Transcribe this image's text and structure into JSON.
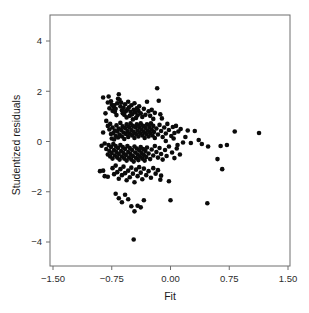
{
  "figure": {
    "background_color": "#ffffff",
    "frame_color": "#6e6e6e",
    "point_color": "#0b0b0b"
  },
  "chart_data": {
    "type": "scatter",
    "title": "",
    "xlabel": "Fit",
    "ylabel": "Studentized residuals",
    "xlim": [
      -1.5,
      1.5
    ],
    "ylim": [
      -4.6,
      4.8
    ],
    "xticks": [
      -1.5,
      -0.75,
      0.0,
      0.75,
      1.5
    ],
    "xtick_labels": [
      "-1.50",
      "-0.75",
      "0.00",
      "0.75",
      "1.50"
    ],
    "yticks": [
      4,
      2,
      0,
      -2,
      -4
    ],
    "ytick_labels": [
      "4",
      "2",
      "0",
      "-2",
      "-4"
    ],
    "grid": false,
    "legend": false,
    "marker": "filled-circle",
    "marker_size_px": 4.6,
    "n_points": 232,
    "points": [
      [
        -0.86,
        1.75
      ],
      [
        -0.79,
        1.79
      ],
      [
        -0.8,
        1.55
      ],
      [
        -0.83,
        1.12
      ],
      [
        -0.86,
        0.36
      ],
      [
        -0.88,
        -0.17
      ],
      [
        -0.9,
        -1.18
      ],
      [
        -0.84,
        -1.38
      ],
      [
        -0.78,
        1.32
      ],
      [
        -0.76,
        1.6
      ],
      [
        -0.75,
        1.46
      ],
      [
        -0.74,
        1.22
      ],
      [
        -0.73,
        1.38
      ],
      [
        -0.72,
        1.44
      ],
      [
        -0.71,
        1.18
      ],
      [
        -0.7,
        1.3
      ],
      [
        -0.69,
        1.05
      ],
      [
        -0.68,
        1.52
      ],
      [
        -0.67,
        1.7
      ],
      [
        -0.66,
        1.88
      ],
      [
        -0.65,
        1.66
      ],
      [
        -0.64,
        1.4
      ],
      [
        -0.63,
        1.55
      ],
      [
        -0.62,
        1.24
      ],
      [
        -0.61,
        1.12
      ],
      [
        -0.6,
        1.34
      ],
      [
        -0.59,
        1.06
      ],
      [
        -0.58,
        1.48
      ],
      [
        -0.57,
        1.2
      ],
      [
        -0.56,
        0.96
      ],
      [
        -0.55,
        1.28
      ],
      [
        -0.54,
        1.58
      ],
      [
        -0.53,
        1.36
      ],
      [
        -0.52,
        1.02
      ],
      [
        -0.51,
        1.18
      ],
      [
        -0.5,
        1.44
      ],
      [
        -0.49,
        1.08
      ],
      [
        -0.48,
        0.88
      ],
      [
        -0.47,
        1.26
      ],
      [
        -0.46,
        1.52
      ],
      [
        -0.45,
        1.16
      ],
      [
        -0.44,
        0.94
      ],
      [
        -0.43,
        1.32
      ],
      [
        -0.42,
        1.04
      ],
      [
        -0.41,
        1.22
      ],
      [
        -0.4,
        1.4
      ],
      [
        -0.38,
        1.12
      ],
      [
        -0.36,
        0.98
      ],
      [
        -0.34,
        1.3
      ],
      [
        -0.32,
        1.06
      ],
      [
        -0.3,
        1.58
      ],
      [
        -0.28,
        1.2
      ],
      [
        -0.26,
        1.02
      ],
      [
        -0.24,
        1.26
      ],
      [
        -0.22,
        0.9
      ],
      [
        -0.2,
        1.14
      ],
      [
        -0.17,
        2.12
      ],
      [
        -0.15,
        1.62
      ],
      [
        -0.13,
        1.08
      ],
      [
        -0.11,
        0.92
      ],
      [
        -0.82,
        0.82
      ],
      [
        -0.8,
        0.62
      ],
      [
        -0.78,
        0.48
      ],
      [
        -0.77,
        0.7
      ],
      [
        -0.76,
        0.3
      ],
      [
        -0.75,
        0.12
      ],
      [
        -0.74,
        0.56
      ],
      [
        -0.73,
        0.34
      ],
      [
        -0.72,
        0.08
      ],
      [
        -0.71,
        0.44
      ],
      [
        -0.7,
        0.22
      ],
      [
        -0.69,
        0.64
      ],
      [
        -0.68,
        0.4
      ],
      [
        -0.67,
        0.16
      ],
      [
        -0.66,
        0.52
      ],
      [
        -0.65,
        0.28
      ],
      [
        -0.64,
        0.74
      ],
      [
        -0.63,
        0.46
      ],
      [
        -0.62,
        0.2
      ],
      [
        -0.61,
        0.6
      ],
      [
        -0.6,
        0.36
      ],
      [
        -0.59,
        0.1
      ],
      [
        -0.58,
        0.54
      ],
      [
        -0.57,
        0.3
      ],
      [
        -0.56,
        0.68
      ],
      [
        -0.55,
        0.42
      ],
      [
        -0.54,
        0.18
      ],
      [
        -0.53,
        0.58
      ],
      [
        -0.52,
        0.32
      ],
      [
        -0.51,
        0.72
      ],
      [
        -0.5,
        0.46
      ],
      [
        -0.49,
        0.24
      ],
      [
        -0.48,
        0.62
      ],
      [
        -0.47,
        0.38
      ],
      [
        -0.46,
        0.14
      ],
      [
        -0.45,
        0.56
      ],
      [
        -0.44,
        0.3
      ],
      [
        -0.43,
        0.68
      ],
      [
        -0.42,
        0.44
      ],
      [
        -0.41,
        0.2
      ],
      [
        -0.4,
        0.58
      ],
      [
        -0.39,
        0.34
      ],
      [
        -0.38,
        0.72
      ],
      [
        -0.37,
        0.48
      ],
      [
        -0.36,
        0.24
      ],
      [
        -0.35,
        0.62
      ],
      [
        -0.34,
        0.38
      ],
      [
        -0.33,
        0.14
      ],
      [
        -0.32,
        0.54
      ],
      [
        -0.31,
        0.3
      ],
      [
        -0.3,
        0.68
      ],
      [
        -0.29,
        0.44
      ],
      [
        -0.28,
        0.2
      ],
      [
        -0.27,
        0.58
      ],
      [
        -0.26,
        0.34
      ],
      [
        -0.25,
        0.72
      ],
      [
        -0.24,
        0.48
      ],
      [
        -0.23,
        0.24
      ],
      [
        -0.22,
        0.62
      ],
      [
        -0.21,
        0.38
      ],
      [
        -0.2,
        0.14
      ],
      [
        -0.18,
        0.52
      ],
      [
        -0.16,
        0.28
      ],
      [
        -0.14,
        0.66
      ],
      [
        -0.12,
        0.42
      ],
      [
        -0.1,
        0.18
      ],
      [
        -0.08,
        0.56
      ],
      [
        -0.06,
        0.32
      ],
      [
        -0.04,
        0.7
      ],
      [
        -0.02,
        0.46
      ],
      [
        0.01,
        0.22
      ],
      [
        0.03,
        0.58
      ],
      [
        0.05,
        0.34
      ],
      [
        0.07,
        0.62
      ],
      [
        0.1,
        0.4
      ],
      [
        -0.84,
        -0.08
      ],
      [
        -0.82,
        -0.3
      ],
      [
        -0.8,
        -0.52
      ],
      [
        -0.79,
        -0.14
      ],
      [
        -0.78,
        -0.38
      ],
      [
        -0.77,
        -0.6
      ],
      [
        -0.76,
        -0.22
      ],
      [
        -0.75,
        -0.46
      ],
      [
        -0.74,
        -0.68
      ],
      [
        -0.73,
        -0.1
      ],
      [
        -0.72,
        -0.34
      ],
      [
        -0.71,
        -0.56
      ],
      [
        -0.7,
        -0.18
      ],
      [
        -0.69,
        -0.42
      ],
      [
        -0.68,
        -0.64
      ],
      [
        -0.67,
        -0.26
      ],
      [
        -0.66,
        -0.5
      ],
      [
        -0.65,
        -0.72
      ],
      [
        -0.64,
        -0.14
      ],
      [
        -0.63,
        -0.38
      ],
      [
        -0.62,
        -0.6
      ],
      [
        -0.61,
        -0.22
      ],
      [
        -0.6,
        -0.46
      ],
      [
        -0.59,
        -0.68
      ],
      [
        -0.58,
        -0.3
      ],
      [
        -0.57,
        -0.54
      ],
      [
        -0.56,
        -0.76
      ],
      [
        -0.55,
        -0.18
      ],
      [
        -0.54,
        -0.42
      ],
      [
        -0.53,
        -0.64
      ],
      [
        -0.52,
        -0.26
      ],
      [
        -0.51,
        -0.5
      ],
      [
        -0.5,
        -0.72
      ],
      [
        -0.49,
        -0.34
      ],
      [
        -0.48,
        -0.58
      ],
      [
        -0.47,
        -0.8
      ],
      [
        -0.46,
        -0.2
      ],
      [
        -0.45,
        -0.44
      ],
      [
        -0.44,
        -0.66
      ],
      [
        -0.43,
        -0.28
      ],
      [
        -0.42,
        -0.52
      ],
      [
        -0.41,
        -0.74
      ],
      [
        -0.4,
        -0.36
      ],
      [
        -0.39,
        -0.6
      ],
      [
        -0.38,
        -0.22
      ],
      [
        -0.37,
        -0.46
      ],
      [
        -0.36,
        -0.68
      ],
      [
        -0.35,
        -0.3
      ],
      [
        -0.34,
        -0.54
      ],
      [
        -0.33,
        -0.76
      ],
      [
        -0.32,
        -0.38
      ],
      [
        -0.31,
        -0.62
      ],
      [
        -0.3,
        -0.24
      ],
      [
        -0.28,
        -0.48
      ],
      [
        -0.26,
        -0.7
      ],
      [
        -0.24,
        -0.32
      ],
      [
        -0.22,
        -0.56
      ],
      [
        -0.2,
        -0.18
      ],
      [
        -0.18,
        -0.42
      ],
      [
        -0.16,
        -0.64
      ],
      [
        -0.14,
        -0.26
      ],
      [
        -0.12,
        -0.5
      ],
      [
        -0.1,
        -0.72
      ],
      [
        -0.07,
        -0.34
      ],
      [
        -0.05,
        -0.58
      ],
      [
        -0.02,
        -0.2
      ],
      [
        0.02,
        -0.44
      ],
      [
        0.05,
        -0.66
      ],
      [
        0.08,
        -0.28
      ],
      [
        0.12,
        -0.52
      ],
      [
        -0.86,
        -1.16
      ],
      [
        -0.8,
        -1.4
      ],
      [
        -0.74,
        -1.06
      ],
      [
        -0.72,
        -1.3
      ],
      [
        -0.7,
        -0.96
      ],
      [
        -0.68,
        -1.22
      ],
      [
        -0.66,
        -1.48
      ],
      [
        -0.64,
        -1.1
      ],
      [
        -0.62,
        -1.34
      ],
      [
        -0.6,
        -1.0
      ],
      [
        -0.58,
        -1.26
      ],
      [
        -0.56,
        -1.54
      ],
      [
        -0.54,
        -1.16
      ],
      [
        -0.52,
        -1.42
      ],
      [
        -0.5,
        -1.04
      ],
      [
        -0.48,
        -1.28
      ],
      [
        -0.46,
        -1.62
      ],
      [
        -0.44,
        -1.12
      ],
      [
        -0.42,
        -1.38
      ],
      [
        -0.4,
        -1.02
      ],
      [
        -0.38,
        -1.24
      ],
      [
        -0.36,
        -1.5
      ],
      [
        -0.34,
        -1.08
      ],
      [
        -0.31,
        -1.34
      ],
      [
        -0.28,
        -1.18
      ],
      [
        -0.25,
        -1.44
      ],
      [
        -0.22,
        -1.06
      ],
      [
        -0.19,
        -1.28
      ],
      [
        -0.16,
        -1.14
      ],
      [
        -0.12,
        -1.36
      ],
      [
        -0.7,
        -2.08
      ],
      [
        -0.66,
        -2.26
      ],
      [
        -0.62,
        -2.42
      ],
      [
        -0.58,
        -2.12
      ],
      [
        -0.54,
        -2.3
      ],
      [
        -0.5,
        -2.58
      ],
      [
        -0.46,
        -2.78
      ],
      [
        -0.42,
        -2.56
      ],
      [
        -0.38,
        -2.62
      ],
      [
        -0.34,
        -2.34
      ],
      [
        -0.13,
        -1.52
      ],
      [
        -0.02,
        -1.58
      ],
      [
        0.0,
        -2.34
      ],
      [
        0.47,
        -2.46
      ],
      [
        -0.47,
        -3.9
      ],
      [
        0.22,
        0.44
      ],
      [
        0.26,
        -0.06
      ],
      [
        0.31,
        0.42
      ],
      [
        0.36,
        0.06
      ],
      [
        0.4,
        -0.1
      ],
      [
        0.48,
        -0.2
      ],
      [
        0.6,
        -0.7
      ],
      [
        0.64,
        -0.18
      ],
      [
        0.66,
        -1.1
      ],
      [
        0.72,
        -0.14
      ],
      [
        0.82,
        0.4
      ],
      [
        1.13,
        0.34
      ],
      [
        0.13,
        0.5
      ],
      [
        0.16,
        -0.04
      ],
      [
        0.19,
        0.18
      ],
      [
        0.09,
        -0.14
      ],
      [
        0.04,
        0.12
      ],
      [
        -0.06,
        0.02
      ]
    ]
  }
}
